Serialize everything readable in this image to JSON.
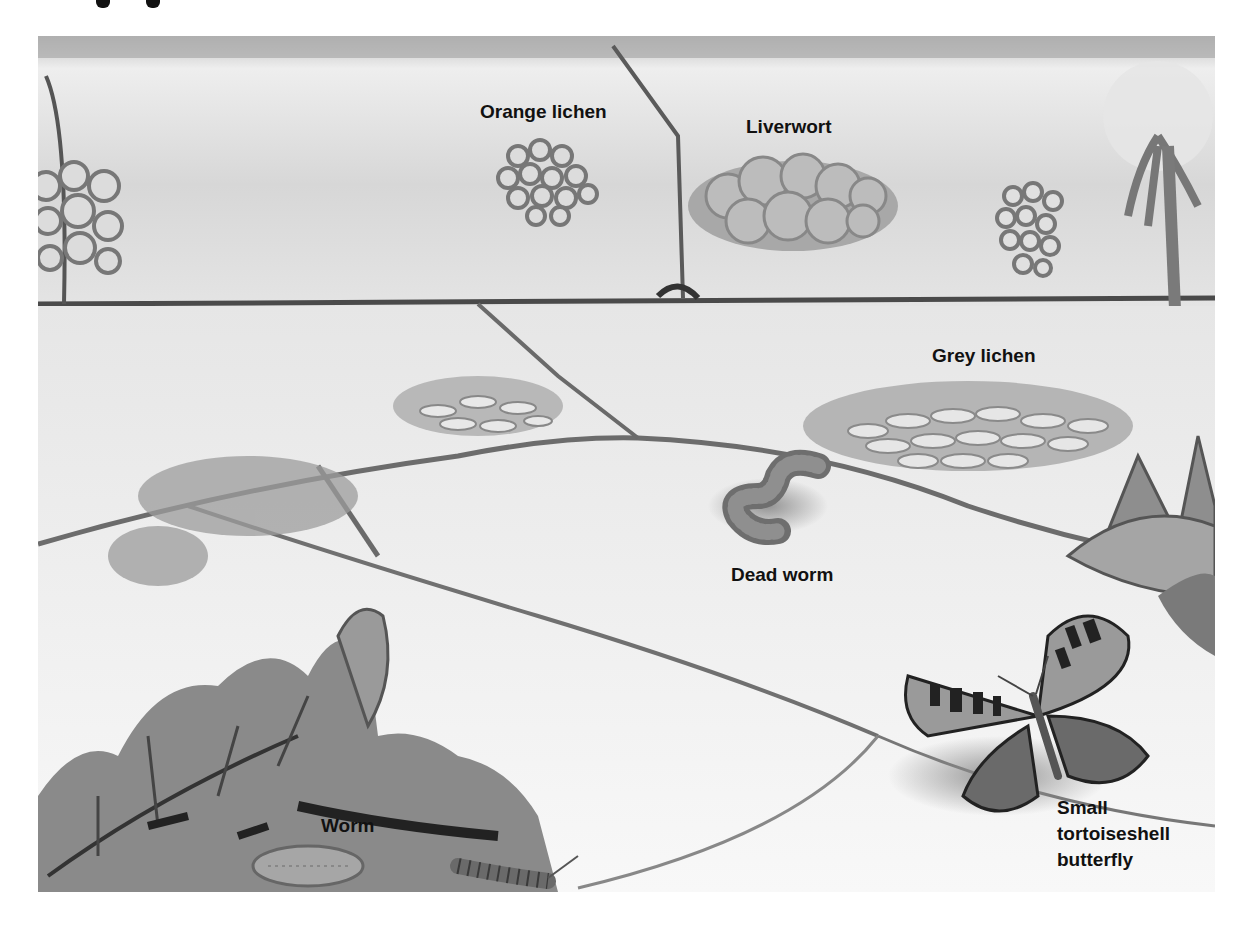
{
  "illustration": {
    "subject": "Wall and paving habitat with lichens, liverwort, worms and butterfly",
    "palette": {
      "background": "#ffffff",
      "stone_light": "#f0f0f0",
      "stone_mid": "#cfcfcf",
      "crack": "#6a6a6a",
      "lichen_fill": "#d9d9d9",
      "lichen_edge": "#7a7a7a",
      "liverwort": "#9a9a9a",
      "leaf": "#8c8c8c",
      "leaf_dark": "#3a3a3a",
      "worm": "#7d7d7d",
      "butterfly_dark": "#2a2a2a",
      "label_text": "#111111"
    }
  },
  "labels": {
    "orange_lichen": "Orange lichen",
    "liverwort": "Liverwort",
    "grey_lichen": "Grey lichen",
    "dead_worm": "Dead worm",
    "worm": "Worm",
    "butterfly": [
      "Small",
      "tortoiseshell",
      "butterfly"
    ]
  }
}
